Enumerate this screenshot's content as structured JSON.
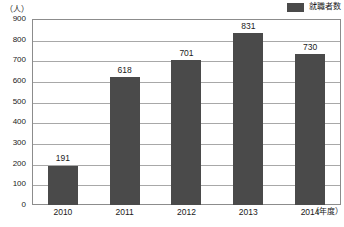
{
  "chart_data": {
    "type": "bar",
    "title": "",
    "categories": [
      "2010",
      "2011",
      "2012",
      "2013",
      "2014"
    ],
    "values": [
      191,
      618,
      701,
      831,
      730
    ],
    "series": [
      {
        "name": "就職者数",
        "values": [
          191,
          618,
          701,
          831,
          730
        ]
      }
    ],
    "xlabel": "（年度）",
    "ylabel": "（人）",
    "ylim": [
      0,
      900
    ],
    "ytick_step": 100,
    "ytick_labels": [
      "900",
      "800",
      "700",
      "600",
      "500",
      "400",
      "300",
      "200",
      "100",
      "0"
    ],
    "ytick_values": [
      900,
      800,
      700,
      600,
      500,
      400,
      300,
      200,
      100,
      0
    ],
    "grid": "horizontal",
    "legend_position": "top-right",
    "bar_color": "#4a4a4a",
    "gridline_color": "#a8a8a8",
    "frame_color": "#8c8c8c",
    "data_labels": [
      "191",
      "618",
      "701",
      "831",
      "730"
    ]
  },
  "legend": {
    "label": "就職者数",
    "swatch_color": "#4a4a4a"
  },
  "axes": {
    "y_unit": "（人）",
    "x_unit": "（年度）"
  }
}
